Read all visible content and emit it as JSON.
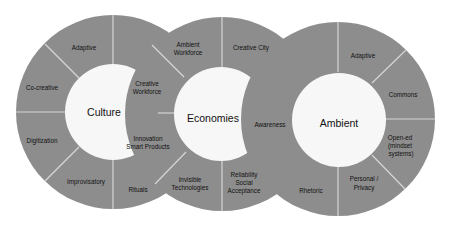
{
  "colors": {
    "ring": "#8d8d8d",
    "center": "#f7f7f7",
    "divider": "#d6d6d6",
    "text": "#111111",
    "background": "#ffffff"
  },
  "circles": [
    {
      "title": "Culture",
      "segments": {
        "adaptive": "Adaptive",
        "co_creative": "Co-creative",
        "digitization": "Digitization",
        "improvisatory": "Improvisatory",
        "rituals": "Rituals",
        "innovation_1": "Innovation",
        "innovation_2": "Smart Products",
        "creative_workforce_1": "Creative",
        "creative_workforce_2": "Workforce"
      }
    },
    {
      "title": "Economies",
      "segments": {
        "ambient_workforce_1": "Ambient",
        "ambient_workforce_2": "Workforce",
        "creative_city": "Creative City",
        "awareness": "Awareness",
        "reliability_1": "Reliability",
        "reliability_2": "Social",
        "reliability_3": "Acceptance",
        "invisible_1": "Invisible",
        "invisible_2": "Technologies"
      }
    },
    {
      "title": "Ambient",
      "segments": {
        "adaptive": "Adaptive",
        "commons": "Commons",
        "open_ed_1": "Open-ed",
        "open_ed_2": "(mindset",
        "open_ed_3": "systems)",
        "personal_1": "Personal /",
        "personal_2": "Privacy",
        "rhetoric": "Rhetoric"
      }
    }
  ]
}
